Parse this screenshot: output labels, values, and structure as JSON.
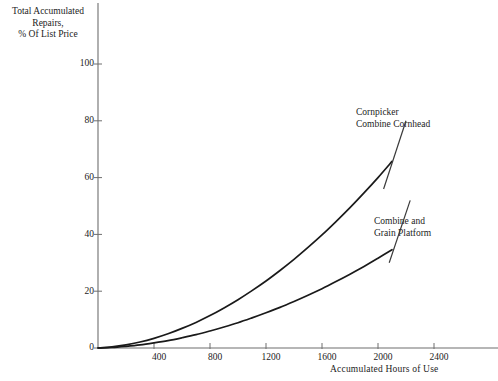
{
  "chart_data": {
    "type": "line",
    "title": "",
    "xlabel": "Accumulated Hours of Use",
    "ylabel": "Total Accumulated\nRepairs,\n% Of List Price",
    "xlim": [
      0,
      2700
    ],
    "ylim": [
      0,
      108
    ],
    "xticks": [
      400,
      800,
      1200,
      1600,
      2000,
      2400
    ],
    "xtick_labels": [
      "400",
      "800",
      "1200",
      "1600",
      "2000",
      "2400"
    ],
    "yticks": [
      0,
      20,
      40,
      60,
      80,
      100
    ],
    "ytick_labels": [
      "0",
      "20",
      "40",
      "60",
      "80",
      "100"
    ],
    "grid": false,
    "legend_position": "inline-annotations",
    "line_color": "#1a1a1a",
    "axis_color": "#6e6e6e",
    "series": [
      {
        "name": "Cornpicker Combine Cornhead",
        "label_text": "Cornpicker\nCombine Cornhead",
        "x": [
          0,
          100,
          200,
          300,
          400,
          500,
          600,
          700,
          800,
          900,
          1000,
          1100,
          1200,
          1300,
          1400,
          1500,
          1600,
          1700,
          1800,
          1900,
          2000,
          2100
        ],
        "values": [
          0,
          0.4,
          1.1,
          2.1,
          3.4,
          5.0,
          6.9,
          9.0,
          11.4,
          14.1,
          17.0,
          20.2,
          23.6,
          27.3,
          31.2,
          35.4,
          39.8,
          44.5,
          49.4,
          54.6,
          60.0,
          65.7
        ]
      },
      {
        "name": "Combine and Grain Platform",
        "label_text": "Combine and\nGrain Platform",
        "x": [
          0,
          100,
          200,
          300,
          400,
          500,
          600,
          700,
          800,
          900,
          1000,
          1100,
          1200,
          1300,
          1400,
          1500,
          1600,
          1700,
          1800,
          1900,
          2000,
          2100
        ],
        "values": [
          0,
          0.2,
          0.6,
          1.1,
          1.8,
          2.6,
          3.6,
          4.7,
          6.0,
          7.4,
          8.9,
          10.6,
          12.4,
          14.3,
          16.4,
          18.6,
          20.9,
          23.4,
          26.0,
          28.7,
          31.6,
          34.6
        ]
      }
    ],
    "annotations": [
      {
        "text": "Cornpicker\nCombine Cornhead",
        "leader_from": [
          2040,
          56
        ],
        "leader_to": [
          2200,
          80
        ]
      },
      {
        "text": "Combine and\nGrain Platform",
        "leader_from": [
          2080,
          30
        ],
        "leader_to": [
          2230,
          52
        ]
      }
    ]
  },
  "axes": {
    "y_title": "Total Accumulated\nRepairs,\n% Of List Price",
    "x_title": "Accumulated Hours of Use",
    "y_labels": [
      "100",
      "80",
      "60",
      "40",
      "20",
      "0"
    ],
    "x_labels": [
      "400",
      "800",
      "1200",
      "1600",
      "2000",
      "2400"
    ]
  }
}
